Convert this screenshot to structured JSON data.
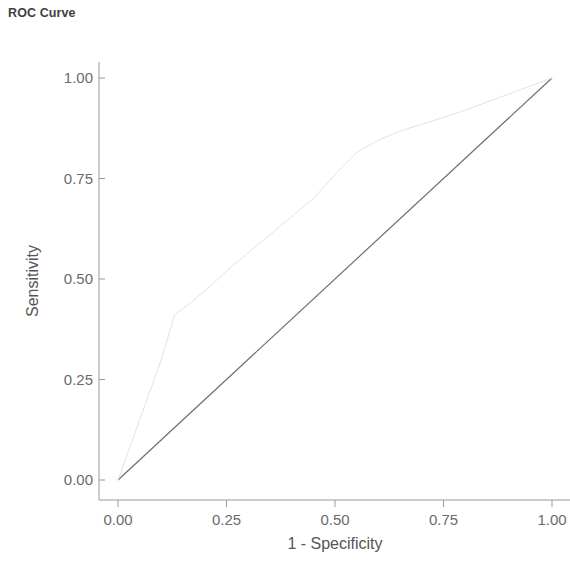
{
  "chart_data": {
    "type": "line",
    "title": "ROC Curve",
    "xlabel": "1 - Specificity",
    "ylabel": "Sensitivity",
    "xlim": [
      0.0,
      1.0
    ],
    "ylim": [
      0.0,
      1.0
    ],
    "xticks": [
      "0.00",
      "0.25",
      "0.50",
      "0.75",
      "1.00"
    ],
    "yticks": [
      "0.00",
      "0.25",
      "0.50",
      "0.75",
      "1.00"
    ],
    "xtick_values": [
      0.0,
      0.25,
      0.5,
      0.75,
      1.0
    ],
    "ytick_values": [
      0.0,
      0.25,
      0.5,
      0.75,
      1.0
    ],
    "grid": false,
    "legend": null,
    "series": [
      {
        "name": "ROC curve",
        "color": "#e2e2e2",
        "linewidth": 1,
        "x": [
          0.0,
          0.02,
          0.04,
          0.06,
          0.08,
          0.1,
          0.115,
          0.13,
          0.16,
          0.2,
          0.25,
          0.3,
          0.35,
          0.4,
          0.45,
          0.5,
          0.55,
          0.6,
          0.65,
          0.7,
          0.75,
          0.8,
          0.85,
          0.9,
          0.95,
          1.0
        ],
        "y": [
          0.0,
          0.06,
          0.12,
          0.18,
          0.24,
          0.3,
          0.355,
          0.41,
          0.435,
          0.47,
          0.52,
          0.565,
          0.61,
          0.655,
          0.7,
          0.76,
          0.815,
          0.845,
          0.868,
          0.885,
          0.902,
          0.92,
          0.94,
          0.96,
          0.98,
          1.0
        ]
      },
      {
        "name": "Reference diagonal",
        "color": "#6e6e72",
        "linewidth": 1.2,
        "x": [
          0.0,
          1.0
        ],
        "y": [
          0.0,
          1.0
        ]
      }
    ]
  },
  "axes": {
    "title": "ROC Curve",
    "x_axis_title": "1 - Specificity",
    "y_axis_title": "Sensitivity",
    "x_tick_labels": [
      "0.00",
      "0.25",
      "0.50",
      "0.75",
      "1.00"
    ],
    "y_tick_labels": [
      "0.00",
      "0.25",
      "0.50",
      "0.75",
      "1.00"
    ]
  },
  "colors": {
    "background": "#ffffff",
    "title_text": "#3f3f3f",
    "tick_text": "#6b6b6b",
    "axis_line": "#9a9a9a",
    "roc_curve": "#e2e2e2",
    "diagonal_line": "#6e6e72"
  }
}
